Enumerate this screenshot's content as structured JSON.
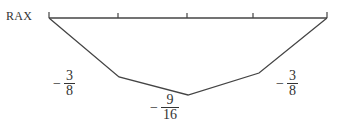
{
  "diagram": {
    "type": "bending-moment / influence diagram",
    "left_label": "RAX",
    "baseline": {
      "x_start": 49,
      "x_end": 327,
      "y": 18,
      "ticks_x": [
        49,
        118,
        187,
        253,
        327
      ]
    },
    "polyline": [
      [
        49,
        18
      ],
      [
        119,
        77
      ],
      [
        188,
        95
      ],
      [
        259,
        73
      ],
      [
        327,
        18
      ]
    ],
    "stroke_color": "#444444",
    "values": [
      {
        "id": "left",
        "sign": "−",
        "numerator": "3",
        "denominator": "8"
      },
      {
        "id": "center",
        "sign": "−",
        "numerator": "9",
        "denominator": "16"
      },
      {
        "id": "right",
        "sign": "−",
        "numerator": "3",
        "denominator": "8"
      }
    ]
  }
}
